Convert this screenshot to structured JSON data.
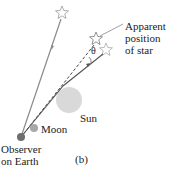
{
  "labels": {
    "apparent": [
      "Apparent",
      "position",
      "of star"
    ],
    "theta": "θ",
    "sun": "Sun",
    "moon": "Moon",
    "observer": [
      "Observer",
      "on Earth"
    ],
    "panel": "(b)"
  },
  "colors": {
    "ray": "#8a8a8a",
    "sun": "#d9d9d9",
    "moon": "#a8a8a8",
    "observer": "#6e6e6e",
    "star": "#888888"
  }
}
